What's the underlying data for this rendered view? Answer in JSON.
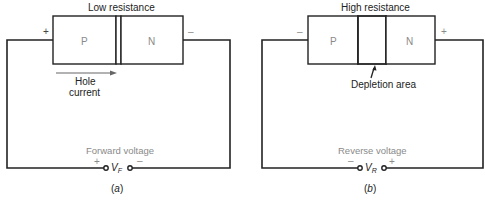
{
  "panels": [
    {
      "id": "a",
      "caption": "(a)",
      "caption_letter": "a",
      "title": "Low resistance",
      "p_label": "P",
      "n_label": "N",
      "left_terminal_sign": "+",
      "right_terminal_sign": "–",
      "arrow_label_line1": "Hole",
      "arrow_label_line2": "current",
      "voltage_label": "Forward voltage",
      "source_plus": "+",
      "source_minus": "–",
      "source_symbol": "V",
      "source_subscript": "F"
    },
    {
      "id": "b",
      "caption": "(b)",
      "caption_letter": "b",
      "title": "High resistance",
      "p_label": "P",
      "n_label": "N",
      "left_terminal_sign": "–",
      "right_terminal_sign": "+",
      "depletion_label": "Depletion area",
      "voltage_label": "Reverse voltage",
      "source_minus": "–",
      "source_plus": "+",
      "source_symbol": "V",
      "source_subscript": "R"
    }
  ],
  "colors": {
    "line": "#222222",
    "gray_text": "#8a8a8a",
    "arrow": "#666666"
  }
}
